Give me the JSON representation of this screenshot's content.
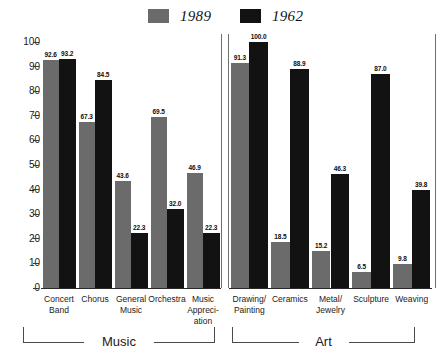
{
  "legend": {
    "items": [
      {
        "label": "1989",
        "color": "#6b6b6b",
        "swatch_name": "legend-swatch-1989"
      },
      {
        "label": "1962",
        "color": "#121212",
        "swatch_name": "legend-swatch-1962"
      }
    ]
  },
  "axis": {
    "ticks": [
      "100",
      "90",
      "80",
      "70",
      "60",
      "50",
      "40",
      "30",
      "20",
      "10",
      "0"
    ]
  },
  "sections": [
    {
      "name": "Music"
    },
    {
      "name": "Art"
    }
  ],
  "chart_data": {
    "type": "bar",
    "title": "",
    "subtitle": "",
    "xlabel": "",
    "ylabel": "",
    "ylim": [
      0,
      100
    ],
    "ytick_step": 10,
    "grid": false,
    "legend_position": "top-center",
    "groups": [
      "Music",
      "Art"
    ],
    "categories": [
      "Concert\nBand",
      "Chorus",
      "General\nMusic",
      "Orchestra",
      "Music\nAppreci-\nation",
      "Drawing/\nPainting",
      "Ceramics",
      "Metal/\nJewelry",
      "Sculpture",
      "Weaving"
    ],
    "category_group": [
      "Music",
      "Music",
      "Music",
      "Music",
      "Music",
      "Art",
      "Art",
      "Art",
      "Art",
      "Art"
    ],
    "series": [
      {
        "name": "1989",
        "color": "#6b6b6b",
        "values": [
          92.6,
          67.3,
          43.6,
          69.5,
          46.9,
          91.3,
          18.5,
          15.2,
          6.5,
          9.8
        ]
      },
      {
        "name": "1962",
        "color": "#121212",
        "values": [
          93.2,
          84.5,
          22.3,
          32.0,
          22.3,
          100.0,
          88.9,
          46.3,
          87.0,
          39.8
        ]
      }
    ],
    "value_labels": [
      [
        "92.6",
        "93.2"
      ],
      [
        "67.3",
        "84.5"
      ],
      [
        "43.6",
        "22.3"
      ],
      [
        "69.5",
        "32.0"
      ],
      [
        "46.9",
        "22.3"
      ],
      [
        "91.3",
        "100.0"
      ],
      [
        "18.5",
        "88.9"
      ],
      [
        "15.2",
        "46.3"
      ],
      [
        "6.5",
        "87.0"
      ],
      [
        "9.8",
        "39.8"
      ]
    ]
  }
}
